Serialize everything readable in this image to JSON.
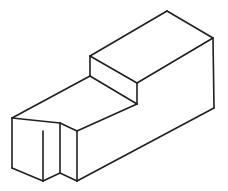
{
  "figure": {
    "name": "isometric-stepped-block-with-front-notch",
    "kind": "line-drawing",
    "canvas": {
      "width": 228,
      "height": 191
    },
    "style": {
      "background_color": "#ffffff",
      "line_color": "#231f20",
      "fill_color": "#ffffff",
      "line_width": 1.6
    },
    "vertices": {
      "left_top_front": [
        12,
        118
      ],
      "left_bottom_front": [
        12,
        168
      ],
      "front_bottom_corner": [
        43,
        181
      ],
      "front_bottom_left_of_notch": [
        43,
        181
      ],
      "notch_top_apex": [
        60,
        123
      ],
      "notch_bottom_apex": [
        60,
        173
      ],
      "notch_right_bottom": [
        77,
        181
      ],
      "notch_right_top": [
        77,
        131
      ],
      "step_front_low": [
        90,
        76
      ],
      "step_front_high": [
        90,
        56
      ],
      "top_apex": [
        167,
        11
      ],
      "right_top": [
        213,
        38
      ],
      "right_bottom": [
        214,
        108
      ],
      "step_inner_right": [
        137,
        104
      ],
      "step_inner_left": [
        90,
        76
      ],
      "lower_front_right": [
        214,
        108
      ]
    },
    "faces": [
      {
        "name": "upper-top-face",
        "points": "90,56 167,11 213,38 137,83"
      },
      {
        "name": "upper-front-face",
        "points": "90,56 137,83 137,104 90,76"
      },
      {
        "name": "lower-top-face",
        "points": "12,118 90,76 137,104 60,123 77,131"
      },
      {
        "name": "right-side-face",
        "points": "213,38 214,108 137,104 137,83"
      },
      {
        "name": "lower-front-face",
        "points": "77,131 137,104 214,108 77,181"
      },
      {
        "name": "left-end-face",
        "points": "12,118 60,123 60,173 43,181 12,168"
      },
      {
        "name": "notch-left-face",
        "points": "43,181 60,173 60,123 43,131"
      },
      {
        "name": "notch-right-face",
        "points": "60,123 77,131 77,181 60,173"
      }
    ],
    "edges": [
      {
        "name": "top-back-left-edge",
        "path": "M 90,56 L 167,11"
      },
      {
        "name": "top-back-right-edge",
        "path": "M 167,11 L 213,38"
      },
      {
        "name": "top-front-right-edge",
        "path": "M 213,38 L 137,83"
      },
      {
        "name": "top-front-left-edge",
        "path": "M 137,83 L 90,56"
      },
      {
        "name": "step-vertical-left-edge",
        "path": "M 90,56 L 90,76"
      },
      {
        "name": "step-vertical-right-edge",
        "path": "M 137,83 L 137,104"
      },
      {
        "name": "step-tread-edge",
        "path": "M 90,76 L 137,104"
      },
      {
        "name": "right-side-vertical-edge",
        "path": "M 213,38 L 214,108"
      },
      {
        "name": "lower-top-left-edge",
        "path": "M 12,118 L 90,76"
      },
      {
        "name": "lower-front-bottom-edge",
        "path": "M 77,181 L 214,108"
      },
      {
        "name": "lower-front-top-edge",
        "path": "M 77,131 L 137,104"
      },
      {
        "name": "notch-right-vertical-edge",
        "path": "M 77,131 L 77,181"
      },
      {
        "name": "notch-apex-vertical-edge",
        "path": "M 60,123 L 60,173"
      },
      {
        "name": "notch-top-left-edge",
        "path": "M 12,118 L 60,123"
      },
      {
        "name": "notch-top-right-edge",
        "path": "M 60,123 L 77,131"
      },
      {
        "name": "notch-bottom-left-edge",
        "path": "M 43,181 L 60,173"
      },
      {
        "name": "notch-bottom-right-edge",
        "path": "M 60,173 L 77,181"
      },
      {
        "name": "left-end-vertical-edge",
        "path": "M 12,118 L 12,168"
      },
      {
        "name": "left-end-bottom-edge",
        "path": "M 12,168 L 43,181"
      },
      {
        "name": "left-end-front-vertical-edge",
        "path": "M 43,131 L 43,181"
      }
    ]
  }
}
